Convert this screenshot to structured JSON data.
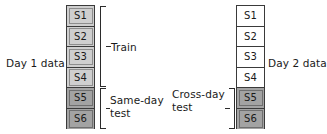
{
  "figure": {
    "type": "diagram"
  },
  "colors": {
    "outline": "#3a3a3a",
    "train_fill": "#cfcfcf",
    "test_fill": "#a3a3a3",
    "day2_fill": "#ffffff",
    "text": "#1a1a1a",
    "bracket": "#2b2b2b"
  },
  "day1": {
    "axis_label": "Day 1 data",
    "cells": [
      {
        "label": "S1",
        "group": "train"
      },
      {
        "label": "S2",
        "group": "train"
      },
      {
        "label": "S3",
        "group": "train"
      },
      {
        "label": "S4",
        "group": "train"
      },
      {
        "label": "S5",
        "group": "test"
      },
      {
        "label": "S6",
        "group": "test"
      }
    ],
    "brackets": [
      {
        "name": "train",
        "label": "Train",
        "covers": [
          "S1",
          "S2",
          "S3",
          "S4"
        ]
      },
      {
        "name": "same-day-test",
        "label_line1": "Same-day",
        "label_line2": "test",
        "covers": [
          "S5",
          "S6"
        ]
      }
    ]
  },
  "day2": {
    "axis_label": "Day 2 data",
    "cells": [
      {
        "label": "S1",
        "group": "unused"
      },
      {
        "label": "S2",
        "group": "unused"
      },
      {
        "label": "S3",
        "group": "unused"
      },
      {
        "label": "S4",
        "group": "unused"
      },
      {
        "label": "S5",
        "group": "test"
      },
      {
        "label": "S6",
        "group": "test"
      }
    ],
    "brackets": [
      {
        "name": "cross-day-test",
        "label_line1": "Cross-day",
        "label_line2": "test",
        "covers": [
          "S5",
          "S6"
        ]
      }
    ]
  }
}
